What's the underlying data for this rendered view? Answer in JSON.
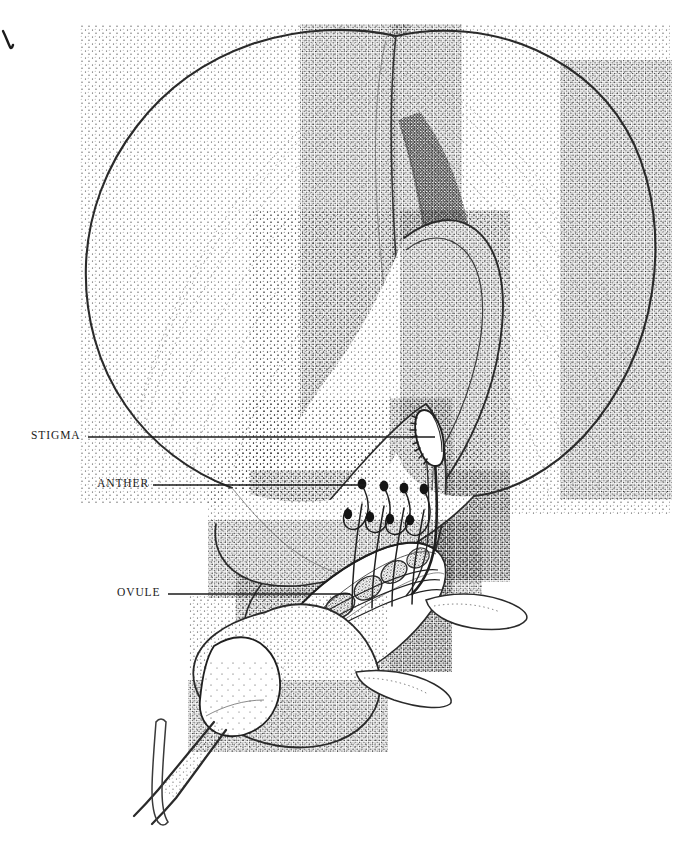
{
  "figure": {
    "kind": "botanical-line-illustration",
    "technique": "pen-and-ink stipple",
    "background_color": "#ffffff",
    "ink_color": "#1b1b1b",
    "stipple_color": "#2a2a2a",
    "canvas": {
      "width": 677,
      "height": 842
    }
  },
  "corner_mark": {
    "name": "pen-check-mark",
    "x": 3,
    "y": 31
  },
  "labels": [
    {
      "id": "stigma",
      "text": "STIGMA",
      "text_x": 31,
      "text_y": 430,
      "leader": {
        "x1": 88,
        "y1": 437,
        "x2": 435,
        "y2": 437
      }
    },
    {
      "id": "anther",
      "text": "ANTHER",
      "text_x": 97,
      "text_y": 478,
      "leader": {
        "x1": 153,
        "y1": 485,
        "x2": 366,
        "y2": 485
      }
    },
    {
      "id": "ovule",
      "text": "OVULE",
      "text_x": 117,
      "text_y": 587,
      "leader": {
        "x1": 168,
        "y1": 594,
        "x2": 350,
        "y2": 594
      }
    }
  ],
  "parts": [
    {
      "name": "banner-petal",
      "note": "large bilobed standard petal, upper"
    },
    {
      "name": "wing-petal",
      "note": "right lateral petal curving down"
    },
    {
      "name": "keel-petal",
      "note": "central boat-shaped petal enclosing stamens"
    },
    {
      "name": "stigma",
      "note": "hooked brush-tipped style apex"
    },
    {
      "name": "anther-group",
      "note": "four dark anthers on curved filaments"
    },
    {
      "name": "ovary",
      "note": "elongate ovary containing ovules"
    },
    {
      "name": "calyx",
      "note": "cup of fused sepals at flower base"
    },
    {
      "name": "sepal-tip",
      "note": "two free pointed sepal lobes to the right"
    },
    {
      "name": "pedicel",
      "note": "flower stalk descending left"
    },
    {
      "name": "bracteole",
      "note": "slender V-shaped bract on the pedicel"
    }
  ]
}
